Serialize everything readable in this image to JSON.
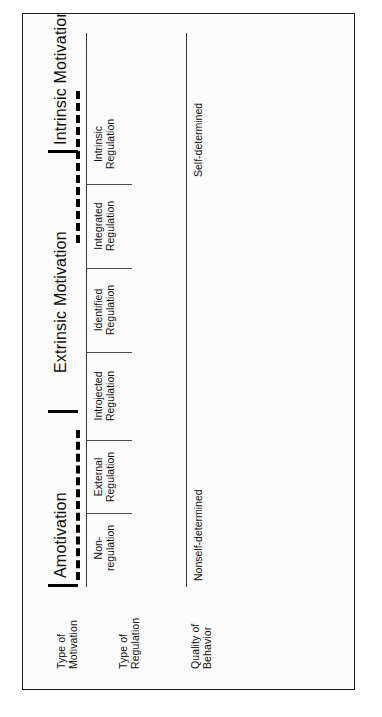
{
  "figure": {
    "diagram_type": "self-determination-continuum",
    "rows": [
      {
        "id": "type-of-motivation",
        "label": "Type of\nMotivation"
      },
      {
        "id": "type-of-regulation",
        "label": "Type of\nRegulation"
      },
      {
        "id": "quality-of-behavior",
        "label": "Quality of\nBehavior"
      }
    ],
    "motivation_bands": [
      {
        "id": "amotivation",
        "label": "Amotivation"
      },
      {
        "id": "extrinsic-motivation",
        "label": "Extrinsic Motivation"
      },
      {
        "id": "intrinsic-motivation",
        "label": "Intrinsic Motivation"
      }
    ],
    "regulation_types": [
      {
        "id": "non-regulation",
        "label": "Non-\nregulation"
      },
      {
        "id": "external-regulation",
        "label": "External\nRegulation"
      },
      {
        "id": "introjected-regulation",
        "label": "Introjected\nRegulation"
      },
      {
        "id": "identified-regulation",
        "label": "Identified\nRegulation"
      },
      {
        "id": "integrated-regulation",
        "label": "Integrated\nRegulation"
      },
      {
        "id": "intrinsic-regulation",
        "label": "Intrinsic\nRegulation"
      }
    ],
    "behavior_quality": [
      {
        "id": "nonself-determined",
        "label": "Nonself-determined"
      },
      {
        "id": "self-determined",
        "label": "Self-determined"
      }
    ],
    "colors": {
      "ink": "#111111",
      "rule": "#3a3a3a",
      "frame": "#1a1a1a",
      "paper": "#fbfbfb"
    }
  }
}
